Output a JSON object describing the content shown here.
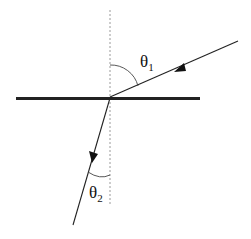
{
  "diagram": {
    "type": "refraction",
    "labels": {
      "theta1": {
        "symbol": "θ",
        "subscript": "1"
      },
      "theta2": {
        "symbol": "θ",
        "subscript": "2"
      }
    },
    "elements": {
      "interface": "horizontal boundary line",
      "normal": "dashed vertical normal line",
      "incident_ray": "incident ray with arrow toward interface",
      "refracted_ray": "refracted ray with arrow away from interface"
    },
    "colors": {
      "line": "#111111",
      "normal": "#999999",
      "background": "#ffffff"
    }
  }
}
